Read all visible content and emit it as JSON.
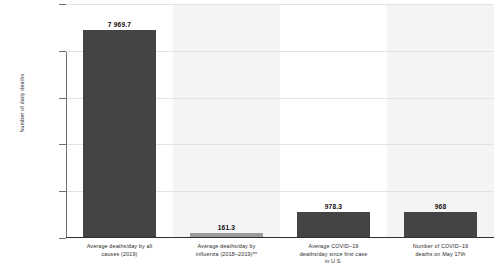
{
  "chart_data": {
    "type": "bar",
    "title": "",
    "subtitle": "",
    "xlabel": "",
    "ylabel": "Number of daily deaths",
    "ylim": [
      0,
      9000
    ],
    "grid": true,
    "legend": "none",
    "categories": [
      "Average deaths/day by all causes (2019)",
      "Average deaths/day by influenza (2018–2019)**",
      "Average COVID–19 deaths/day since first case in U.S.",
      "Number of COVID–19 deaths on May 17th"
    ],
    "category_lines": [
      [
        "Average deaths/day by all",
        "causes (2019)"
      ],
      [
        "Average deaths/day by",
        "influenza (2018–2019)**"
      ],
      [
        "Average COVID–19",
        "deaths/day since first case",
        "in U.S."
      ],
      [
        "Number of COVID–19",
        "deaths on May 17th"
      ]
    ],
    "values": [
      7969.7,
      161.3,
      978.3,
      968
    ],
    "value_labels": [
      "7 969.7",
      "161.3",
      "978.3",
      "968"
    ],
    "bar_colors": [
      "#444444",
      "#9a9a9a",
      "#444444",
      "#444444"
    ],
    "tick_labels": [],
    "axis_tick_count": 5
  },
  "colors": {
    "bar_dark": "#444444",
    "bar_light": "#9a9a9a",
    "band": "#f4f4f4",
    "gridline": "#e2e2e2",
    "axis": "#2f2f2f",
    "background": "#ffffff"
  }
}
